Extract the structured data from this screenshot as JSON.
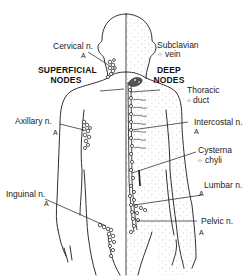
{
  "figure": {
    "type": "anatomical-diagram",
    "sections": {
      "left": "SUPERFICIAL\nNODES",
      "right": "DEEP\nNODES"
    },
    "section_lines": {
      "superficial_1": "SUPERFICIAL",
      "superficial_2": "NODES",
      "deep_1": "DEEP",
      "deep_2": "NODES"
    },
    "labels": {
      "cervical": {
        "text": "Cervical n.",
        "marker": "A"
      },
      "subclavian": {
        "text": "Subclavian",
        "text2": "vein",
        "marker": "⁘"
      },
      "thoracic": {
        "text": "Thoracic",
        "text2": "duct",
        "marker": "⁘"
      },
      "axillary": {
        "text": "Axillary n.",
        "marker": "A"
      },
      "intercostal": {
        "text": "Intercostal n.",
        "marker": "A"
      },
      "cisterna": {
        "text": "Cysterna",
        "text2": "chyli",
        "marker": "⁘"
      },
      "lumbar": {
        "text": "Lumbar n.",
        "marker": "A"
      },
      "inguinal": {
        "text": "Inguinal n.",
        "marker": "A"
      },
      "pelvic": {
        "text": "Pelvic n.",
        "marker": "A"
      }
    },
    "colors": {
      "line": "#1a1a1a",
      "stipple": "#8a8a8a",
      "background": "#ffffff"
    }
  }
}
